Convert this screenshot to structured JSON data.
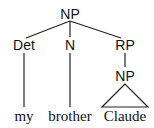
{
  "tree": {
    "root": {
      "label": "NP"
    },
    "children": [
      {
        "label": "Det",
        "word": "my"
      },
      {
        "label": "N",
        "word": "brother"
      },
      {
        "label": "RP",
        "child": {
          "label": "NP",
          "word": "Claude",
          "triangle": true
        }
      }
    ]
  },
  "colors": {
    "line": "#222222",
    "text": "#111111",
    "background": "#ffffff"
  }
}
